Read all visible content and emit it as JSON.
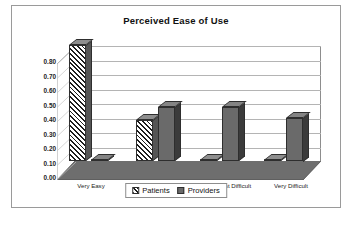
{
  "chart_data": {
    "type": "bar",
    "title": "Perceived Ease of Use",
    "xlabel": "",
    "ylabel": "",
    "ylim": [
      0.0,
      0.8
    ],
    "ytick_labels": [
      "0.80",
      "0.70",
      "0.60",
      "0.50",
      "0.40",
      "0.30",
      "0.20",
      "0.10",
      "0.00"
    ],
    "ytick_values": [
      0.8,
      0.7,
      0.6,
      0.5,
      0.4,
      0.3,
      0.2,
      0.1,
      0.0
    ],
    "grid": true,
    "legend_position": "bottom",
    "style": "3d-clustered-column",
    "categories": [
      "Very Easy",
      "Somewhat Easy",
      "Somewhat Difficult",
      "Very Difficult"
    ],
    "series": [
      {
        "name": "Patients",
        "pattern": "diagonal-hatch",
        "color": "#1d1d1d",
        "values": [
          0.8,
          0.28,
          0.0,
          0.0
        ]
      },
      {
        "name": "Providers",
        "pattern": "solid",
        "color": "#6a6a6a",
        "values": [
          0.0,
          0.37,
          0.37,
          0.3
        ]
      }
    ]
  },
  "legend": {
    "items": [
      {
        "label": "Patients"
      },
      {
        "label": "Providers"
      }
    ]
  },
  "colors": {
    "frame_border": "#9a9a9a",
    "gridline": "#b4b4b4",
    "axis": "#6e6e6e",
    "floor": "#6e6e6e",
    "patients": "#1d1d1d",
    "providers": "#6a6a6a",
    "text": "#111111"
  }
}
